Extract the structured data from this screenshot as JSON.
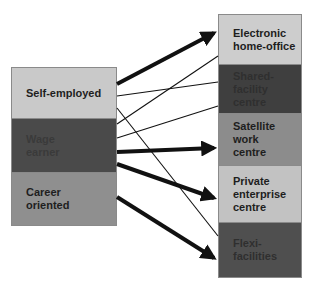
{
  "left_nodes": [
    {
      "id": "self-employed",
      "label": "Self-employed",
      "color": "#c9c9c9",
      "text_color": "#1e1e1e"
    },
    {
      "id": "wage-earner",
      "label": "Wage\nearner",
      "color": "#4a4a4a",
      "text_color": "#3a3a3a"
    },
    {
      "id": "career-oriented",
      "label": "Career\noriented",
      "color": "#8f8f8f",
      "text_color": "#1e1e1e"
    }
  ],
  "right_nodes": [
    {
      "id": "electronic-home-office",
      "label": "Electronic\nhome-office",
      "color": "#cdcdcd",
      "text_color": "#1e1e1e"
    },
    {
      "id": "shared-facility-centre",
      "label": "Shared-facility\ncentre",
      "color": "#3f3f3f",
      "text_color": "#2f2f2f"
    },
    {
      "id": "satellite-work-centre",
      "label": "Satellite work\ncentre",
      "color": "#8c8c8c",
      "text_color": "#1e1e1e"
    },
    {
      "id": "private-enterprise-centre",
      "label": "Private enterprise\ncentre",
      "color": "#c2c2c2",
      "text_color": "#1e1e1e"
    },
    {
      "id": "flexi-facilities",
      "label": "Flexi-facilities",
      "color": "#4f4f4f",
      "text_color": "#2f2f2f"
    }
  ],
  "links": [
    {
      "from": "self-employed",
      "to": "electronic-home-office",
      "strength": "strong"
    },
    {
      "from": "self-employed",
      "to": "shared-facility-centre",
      "strength": "weak"
    },
    {
      "from": "self-employed",
      "to": "flexi-facilities",
      "strength": "weak"
    },
    {
      "from": "wage-earner",
      "to": "electronic-home-office",
      "strength": "weak"
    },
    {
      "from": "wage-earner",
      "to": "shared-facility-centre",
      "strength": "weak"
    },
    {
      "from": "wage-earner",
      "to": "satellite-work-centre",
      "strength": "strong"
    },
    {
      "from": "wage-earner",
      "to": "private-enterprise-centre",
      "strength": "strong"
    },
    {
      "from": "career-oriented",
      "to": "flexi-facilities",
      "strength": "strong"
    }
  ]
}
